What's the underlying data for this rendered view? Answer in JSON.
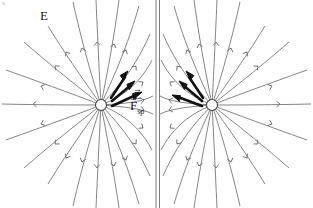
{
  "figure": {
    "labels": {
      "field_label": "E",
      "field_vector_label": "E",
      "force_label": "F",
      "force_subscript": "sp",
      "vector_arrow": "→",
      "corner_mark": "s"
    },
    "colors": {
      "background": "#ffffff",
      "field_line": "#6e6e6e",
      "field_arrowhead": "#6e6e6e",
      "bold_vector": "#111111",
      "charge_outline": "#444444",
      "charge_fill": "#ffffff",
      "center_line": "#7a7a7a",
      "text": "#1a1a1a"
    },
    "charges": [
      {
        "name": "left-charge",
        "cx": 101,
        "cy": 105,
        "r": 5.5,
        "polarity": "positive"
      },
      {
        "name": "right-charge",
        "cx": 212,
        "cy": 105,
        "r": 5.5,
        "polarity": "positive"
      }
    ],
    "center_plane": {
      "name": "neutral-plane",
      "x_left": 155.5,
      "x_right": 159.5,
      "y_top": 0,
      "y_bottom": 208
    },
    "field_direction": "outward from each charge, deflected away from the central plane",
    "bold_vectors": [
      {
        "name": "left-vector-upper",
        "x1": 111,
        "y1": 98,
        "x2": 128,
        "y2": 73
      },
      {
        "name": "left-vector-middle",
        "x1": 112,
        "y1": 101,
        "x2": 134,
        "y2": 82
      },
      {
        "name": "left-vector-lower",
        "x1": 112,
        "y1": 105,
        "x2": 141,
        "y2": 93
      },
      {
        "name": "right-vector-upper",
        "x1": 203,
        "y1": 98,
        "x2": 188,
        "y2": 73
      },
      {
        "name": "right-vector-middle",
        "x1": 202,
        "y1": 101,
        "x2": 180,
        "y2": 82
      },
      {
        "name": "right-vector-lower",
        "x1": 202,
        "y1": 105,
        "x2": 172,
        "y2": 96
      }
    ]
  }
}
